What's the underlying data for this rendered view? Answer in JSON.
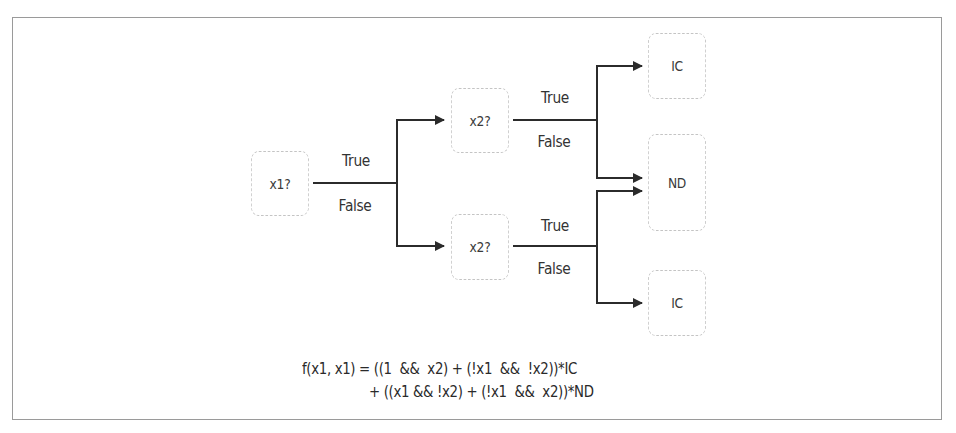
{
  "diagram": {
    "type": "decision-tree",
    "nodes": [
      {
        "id": "x1",
        "label": "x1?",
        "x": 247,
        "y": 151,
        "w": 66,
        "h": 65
      },
      {
        "id": "x2_top",
        "label": "x2?",
        "x": 447,
        "y": 88,
        "w": 66,
        "h": 65
      },
      {
        "id": "x2_bottom",
        "label": "x2?",
        "x": 447,
        "y": 214,
        "w": 66,
        "h": 66
      },
      {
        "id": "ic_top",
        "label": "IC",
        "x": 644,
        "y": 33,
        "w": 66,
        "h": 66
      },
      {
        "id": "nd",
        "label": "ND",
        "x": 644,
        "y": 134,
        "w": 66,
        "h": 97
      },
      {
        "id": "ic_bottom",
        "label": "IC",
        "x": 644,
        "y": 270,
        "w": 66,
        "h": 66
      }
    ],
    "edge_labels": {
      "x1_true": "True",
      "x1_false": "False",
      "x2_top_true": "True",
      "x2_top_false": "False",
      "x2_bottom_true": "True",
      "x2_bottom_false": "False"
    },
    "edges": [
      {
        "from": "x1",
        "to": "x2_top",
        "condition": "True"
      },
      {
        "from": "x1",
        "to": "x2_bottom",
        "condition": "False"
      },
      {
        "from": "x2_top",
        "to": "ic_top",
        "condition": "True"
      },
      {
        "from": "x2_top",
        "to": "nd",
        "condition": "False"
      },
      {
        "from": "x2_bottom",
        "to": "nd",
        "condition": "True"
      },
      {
        "from": "x2_bottom",
        "to": "ic_bottom",
        "condition": "False"
      }
    ],
    "formula": {
      "line1": "f(x1, x1) = ((1  &&  x2) + (!x1  &&  !x2))*IC",
      "line2": "+ ((x1 && !x2) + (!x1  &&  x2))*ND"
    },
    "colors": {
      "frame": "#9a9a9a",
      "node_border": "#c4c4c4",
      "edge": "#2b2b2b",
      "text": "#333333"
    }
  }
}
